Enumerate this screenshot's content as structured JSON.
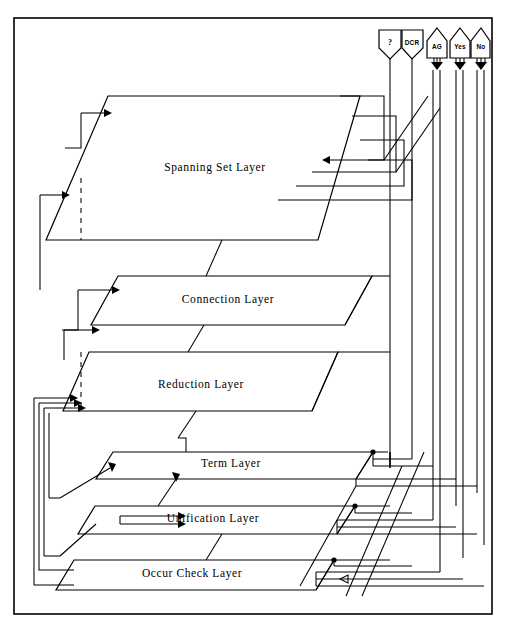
{
  "diagram": {
    "background_color": "#ffffff",
    "line_color": "#000000",
    "frame": {
      "x": 14,
      "y": 18,
      "width": 478,
      "height": 596
    },
    "layers": [
      {
        "id": "spanning-set",
        "label": "Spanning Set Layer",
        "label_x": 215,
        "label_y": 168
      },
      {
        "id": "connection",
        "label": "Connection Layer",
        "label_x": 228,
        "label_y": 300
      },
      {
        "id": "reduction",
        "label": "Reduction Layer",
        "label_x": 201,
        "label_y": 385
      },
      {
        "id": "term",
        "label": "Term Layer",
        "label_x": 231,
        "label_y": 464
      },
      {
        "id": "unification",
        "label": "Unification Layer",
        "label_x": 213,
        "label_y": 519
      },
      {
        "id": "occur-check",
        "label": "Occur Check Layer",
        "label_x": 192,
        "label_y": 574
      }
    ],
    "ports": [
      {
        "id": "query",
        "label": "?",
        "shape": "flag-square",
        "cx": 390,
        "label_y": 43
      },
      {
        "id": "dcr",
        "label": "DCR",
        "shape": "flag-square",
        "cx": 412,
        "label_y": 43
      },
      {
        "id": "ag",
        "label": "AG",
        "shape": "flag-round",
        "cx": 437,
        "label_y": 47
      },
      {
        "id": "yes",
        "label": "Yes",
        "shape": "flag-round",
        "cx": 460,
        "label_y": 47
      },
      {
        "id": "no",
        "label": "No",
        "shape": "flag-round",
        "cx": 481,
        "label_y": 47
      }
    ]
  }
}
